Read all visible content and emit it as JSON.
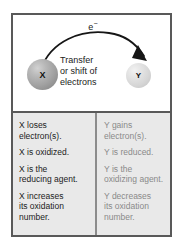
{
  "figure": {
    "colors": {
      "border": "#595959",
      "table_background": "#e9e9e9",
      "column_divider": "#8c8c8c",
      "sphere_x": "#a1a1a1",
      "sphere_y": "#d6d6d6",
      "text_x": "#1c1c1c",
      "text_y": "#8a8a8a"
    }
  },
  "diagram": {
    "electron_label": "e",
    "electron_charge": "−",
    "arrow_name": "curved-transfer-arrow",
    "center_caption": [
      "Transfer",
      "or shift of",
      "electrons"
    ],
    "species": {
      "left": {
        "label": "X",
        "name": "sphere-x"
      },
      "right": {
        "label": "Y",
        "name": "sphere-y"
      }
    }
  },
  "table": {
    "columns": [
      {
        "key": "x",
        "species": "X",
        "statements": [
          [
            "X loses",
            "electron(s)."
          ],
          [
            "X is oxidized."
          ],
          [
            "X is the",
            "reducing agent."
          ],
          [
            "X increases",
            "its oxidation",
            "number."
          ]
        ]
      },
      {
        "key": "y",
        "species": "Y",
        "statements": [
          [
            "Y gains",
            "electron(s)."
          ],
          [
            "Y is reduced."
          ],
          [
            "Y is the",
            "oxidizing agent."
          ],
          [
            "Y decreases",
            "its oxidation",
            "number."
          ]
        ]
      }
    ]
  }
}
